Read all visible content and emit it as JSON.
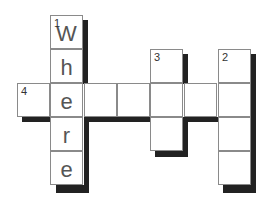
{
  "puzzle": {
    "type": "crossword",
    "cell_size": 34,
    "colors": {
      "cell_bg": "#ffffff",
      "cell_border": "#8a8a8a",
      "shadow": "#222222",
      "letter": "#555555"
    },
    "entries": [
      {
        "number": "1",
        "direction": "down",
        "answer": "Where",
        "length": 5
      },
      {
        "number": "2",
        "direction": "down",
        "answer": "",
        "length": 4
      },
      {
        "number": "3",
        "direction": "down",
        "answer": "",
        "length": 3
      },
      {
        "number": "4",
        "direction": "across",
        "answer": "",
        "length": 7
      }
    ],
    "cells": [
      {
        "x": 50,
        "y": 15,
        "num": "1",
        "letter": "W"
      },
      {
        "x": 50,
        "y": 49,
        "num": "",
        "letter": "h"
      },
      {
        "x": 17,
        "y": 83,
        "num": "4",
        "letter": ""
      },
      {
        "x": 50,
        "y": 83,
        "num": "",
        "letter": "e"
      },
      {
        "x": 84,
        "y": 83,
        "num": "",
        "letter": ""
      },
      {
        "x": 117,
        "y": 83,
        "num": "",
        "letter": ""
      },
      {
        "x": 150,
        "y": 83,
        "num": "",
        "letter": ""
      },
      {
        "x": 184,
        "y": 83,
        "num": "",
        "letter": ""
      },
      {
        "x": 218,
        "y": 83,
        "num": "",
        "letter": ""
      },
      {
        "x": 50,
        "y": 117,
        "num": "",
        "letter": "r"
      },
      {
        "x": 50,
        "y": 151,
        "num": "",
        "letter": "e"
      },
      {
        "x": 150,
        "y": 49,
        "num": "3",
        "letter": ""
      },
      {
        "x": 150,
        "y": 117,
        "num": "",
        "letter": ""
      },
      {
        "x": 218,
        "y": 49,
        "num": "2",
        "letter": ""
      },
      {
        "x": 218,
        "y": 117,
        "num": "",
        "letter": ""
      },
      {
        "x": 218,
        "y": 151,
        "num": "",
        "letter": ""
      }
    ]
  }
}
